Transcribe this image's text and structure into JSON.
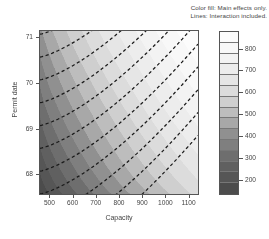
{
  "annotation": {
    "line1": "Color fill: Main effects only.",
    "line2": "Lines: Interaction included."
  },
  "chart_data": {
    "type": "heatmap",
    "title": "",
    "subtitle": "Color fill: Main effects only. Lines: Interaction included.",
    "xlabel": "Capacity",
    "ylabel": "Permit date",
    "xlim": [
      455,
      1145
    ],
    "ylim": [
      67.55,
      71.15
    ],
    "xticks": [
      500,
      600,
      700,
      800,
      900,
      1000,
      1100
    ],
    "yticks": [
      68,
      69,
      70,
      71
    ],
    "grid": false,
    "legend_position": "right",
    "colorbar": {
      "ticks": [
        200,
        300,
        400,
        500,
        600,
        700,
        800
      ],
      "range": [
        130,
        880
      ],
      "levels": [
        130,
        180,
        230,
        280,
        330,
        380,
        430,
        480,
        530,
        580,
        630,
        680,
        730,
        780,
        830,
        880
      ],
      "colors": [
        "#4c4c4c",
        "#565656",
        "#606060",
        "#6e6e6e",
        "#7f7f7f",
        "#909090",
        "#a8a8a8",
        "#bdbdbd",
        "#cfcfcf",
        "#dcdcdc",
        "#e6e6e6",
        "#ededed",
        "#f3f3f3",
        "#f8f8f8",
        "#fcfcfc"
      ]
    },
    "fill_description": "Grayscale response surface, additive main-effects model: value increases from dark (low, ~150) at low Capacity / early Permit date toward near-white (high, ~850) at high Capacity / late Permit date.",
    "fill_bands": [
      {
        "level_low": 130,
        "level_high": 180,
        "color": "#4c4c4c"
      },
      {
        "level_low": 180,
        "level_high": 230,
        "color": "#565656"
      },
      {
        "level_low": 230,
        "level_high": 280,
        "color": "#606060"
      },
      {
        "level_low": 280,
        "level_high": 330,
        "color": "#6e6e6e"
      },
      {
        "level_low": 330,
        "level_high": 380,
        "color": "#7f7f7f"
      },
      {
        "level_low": 380,
        "level_high": 430,
        "color": "#909090"
      },
      {
        "level_low": 430,
        "level_high": 480,
        "color": "#a8a8a8"
      },
      {
        "level_low": 480,
        "level_high": 530,
        "color": "#bdbdbd"
      },
      {
        "level_low": 530,
        "level_high": 580,
        "color": "#cfcfcf"
      },
      {
        "level_low": 580,
        "level_high": 630,
        "color": "#dcdcdc"
      },
      {
        "level_low": 630,
        "level_high": 680,
        "color": "#e6e6e6"
      },
      {
        "level_low": 680,
        "level_high": 730,
        "color": "#ededed"
      },
      {
        "level_low": 730,
        "level_high": 780,
        "color": "#f3f3f3"
      },
      {
        "level_low": 780,
        "level_high": 830,
        "color": "#f8f8f8"
      },
      {
        "level_low": 830,
        "level_high": 880,
        "color": "#fcfcfc"
      }
    ],
    "contour_lines": {
      "style": "dashed",
      "color": "#1a1a1a",
      "description": "Interaction model contours: curved lines running from upper-left to lower-right, concave toward upper right.",
      "count": 10
    }
  },
  "axes": {
    "x": {
      "title": "Capacity",
      "ticks": [
        {
          "value": 500,
          "label": "500"
        },
        {
          "value": 600,
          "label": "600"
        },
        {
          "value": 700,
          "label": "700"
        },
        {
          "value": 800,
          "label": "800"
        },
        {
          "value": 900,
          "label": "900"
        },
        {
          "value": 1000,
          "label": "1000"
        },
        {
          "value": 1100,
          "label": "1100"
        }
      ]
    },
    "y": {
      "title": "Permit date",
      "ticks": [
        {
          "value": 68,
          "label": "68"
        },
        {
          "value": 69,
          "label": "69"
        },
        {
          "value": 70,
          "label": "70"
        },
        {
          "value": 71,
          "label": "71"
        }
      ]
    }
  },
  "colorbar_labels": [
    "800",
    "700",
    "600",
    "500",
    "400",
    "300",
    "200"
  ]
}
